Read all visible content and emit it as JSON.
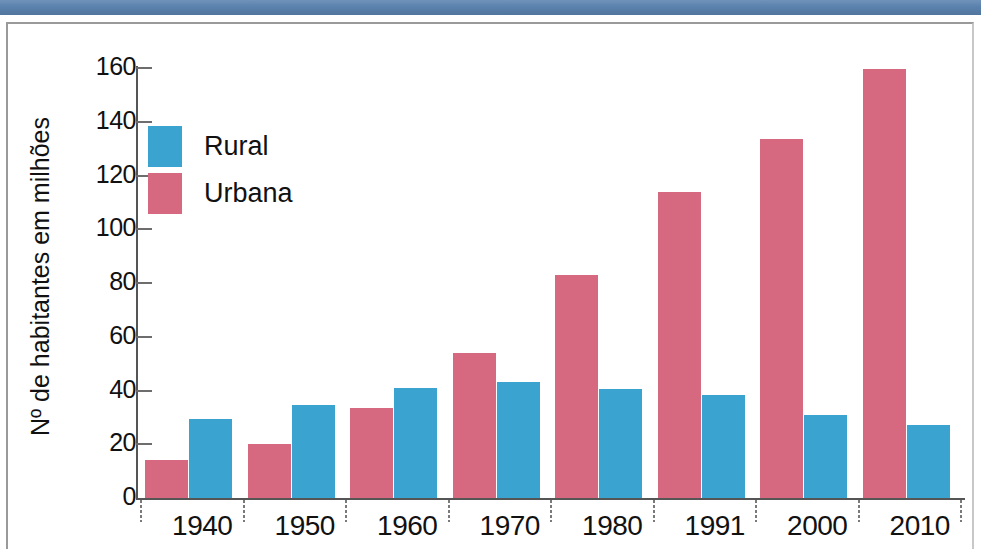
{
  "chart_data": {
    "type": "bar",
    "title": "",
    "subtitle": "",
    "xlabel": "",
    "ylabel": "Nº de habitantes em milhões",
    "categories": [
      "1940",
      "1950",
      "1960",
      "1970",
      "1980",
      "1991",
      "2000",
      "2010"
    ],
    "series": [
      {
        "name": "Urbana",
        "color": "#d6687f",
        "values": [
          14,
          20,
          33.5,
          54,
          83,
          114,
          133.5,
          159.5
        ]
      },
      {
        "name": "Rural",
        "color": "#3ba3d0",
        "values": [
          29.5,
          34.5,
          41,
          43,
          40.5,
          38.5,
          31,
          27
        ]
      }
    ],
    "ylim": [
      0,
      160
    ],
    "yticks": [
      0,
      20,
      40,
      60,
      80,
      100,
      120,
      140,
      160
    ],
    "ytick_labels": [
      "0",
      "20",
      "40",
      "60",
      "80",
      "100",
      "120",
      "140",
      "160"
    ],
    "grid": false,
    "legend_position": "upper-left",
    "series_order_in_group": [
      "Urbana",
      "Rural"
    ]
  },
  "axes": {
    "y_title": "Nº de habitantes em milhões",
    "y_tick_labels": [
      "160",
      "140",
      "120",
      "100",
      "80",
      "60",
      "40",
      "20",
      "0"
    ],
    "x_tick_labels": [
      "1940",
      "1950",
      "1960",
      "1970",
      "1980",
      "1991",
      "2000",
      "2010"
    ]
  },
  "legend": {
    "items": [
      {
        "label": "Rural",
        "color": "#3ba3d0"
      },
      {
        "label": "Urbana",
        "color": "#d6687f"
      }
    ]
  },
  "colors": {
    "rural": "#3ba3d0",
    "urbana": "#d6687f",
    "banner": "#5b82ad",
    "axis": "#555555",
    "frame": "#9a9a9a"
  }
}
